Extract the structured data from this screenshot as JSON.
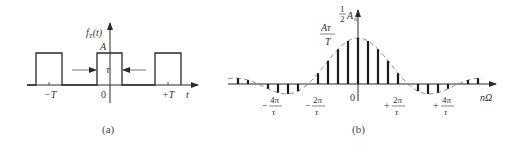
{
  "panel_a": {
    "caption": "(a)",
    "ylabel": "f_T(t)",
    "ylabel_main": "f",
    "ylabel_sub": "T",
    "ylabel_arg": "(t)",
    "xlabel": "t",
    "amplitude_label": "A",
    "width_label": "τ",
    "ticks": [
      "−T",
      "0",
      "+T"
    ],
    "description": "Periodic rectangular pulse train with amplitude A, pulse width τ, period T"
  },
  "panel_b": {
    "caption": "(b)",
    "ylabel_frac": "1",
    "ylabel_den": "2",
    "ylabel_var": "A",
    "ylabel_sub": "n",
    "peak_label_num": "Aτ",
    "peak_label_den": "T",
    "xlabel": "nΩ",
    "zero_label": "0",
    "ticks": [
      {
        "sign": "−",
        "num": "4π",
        "den": "τ"
      },
      {
        "sign": "−",
        "num": "2π",
        "den": "τ"
      },
      {
        "sign": "+",
        "num": "2π",
        "den": "τ"
      },
      {
        "sign": "+",
        "num": "4π",
        "den": "τ"
      }
    ],
    "description": "Line spectrum (½Aₙ) with sinc-shaped dashed envelope; zeros at ±2π/τ, ±4π/τ"
  },
  "colors": {
    "line": "#2a2a2a",
    "envelope": "#777777",
    "text": "#333333"
  }
}
